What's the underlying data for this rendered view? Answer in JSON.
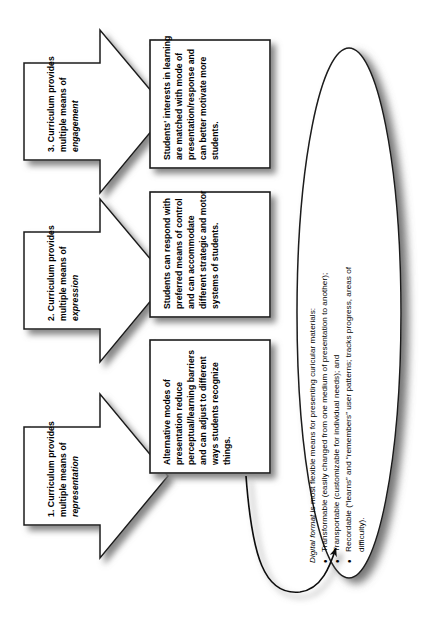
{
  "diagram": {
    "orientation": "rotated-90-ccw",
    "colors": {
      "stroke": "#1a1a1a",
      "fill": "#ffffff",
      "shadow": "#9a9a9a",
      "text": "#000000"
    }
  },
  "arrows": [
    {
      "id": "arrow-1",
      "line1": "1. Curriculum provides",
      "line2": "multiple means of",
      "line3_italic": "representation"
    },
    {
      "id": "arrow-2",
      "line1": "2. Curriculum provides",
      "line2": "multiple means of",
      "line3_italic": "expression"
    },
    {
      "id": "arrow-3",
      "line1": "3. Curriculum provides",
      "line2": "multiple means of",
      "line3_italic": "engagement"
    }
  ],
  "boxes": [
    {
      "id": "box-1",
      "lines": [
        "Alternative modes of",
        "presentation reduce",
        "perceptual/learning barriers",
        "and can adjust to different",
        "ways students recognize",
        "things."
      ]
    },
    {
      "id": "box-2",
      "lines": [
        "Students can respond with",
        "preferred means of control",
        "and can accommodate",
        "different strategic and motor",
        "systems of students."
      ]
    },
    {
      "id": "box-3",
      "lines": [
        "Students' interests in learning",
        "are matched with mode of",
        "presentation/response and",
        "can better motivate more",
        "students."
      ]
    }
  ],
  "oval": {
    "id": "oval-digital-format",
    "heading_italic": "Digital format",
    "heading_rest": " is most flexible means for presenting curicular materials:",
    "bullets": [
      "Transformable (easily changed from one medium of presentation to another);",
      "Transportable (customizable for individual needs); and",
      "Recordable (“learns” and “remembers” user patterns; tracks progress, areas of",
      "difficulty)."
    ]
  },
  "connector": {
    "id": "curved-arrow",
    "from": "box-1",
    "to": "oval-digital-format"
  }
}
